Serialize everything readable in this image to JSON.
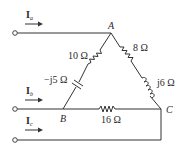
{
  "diagram": {
    "type": "circuit",
    "title": "",
    "nodes": [
      {
        "id": "A",
        "label": "A"
      },
      {
        "id": "B",
        "label": "B"
      },
      {
        "id": "C",
        "label": "C"
      }
    ],
    "currents": [
      {
        "id": "Ia",
        "symbol": "I",
        "subscript": "a",
        "terminal": "a",
        "to_node": "A"
      },
      {
        "id": "Ib",
        "symbol": "I",
        "subscript": "b",
        "terminal": "b",
        "to_node": "B"
      },
      {
        "id": "Ic",
        "symbol": "I",
        "subscript": "c",
        "terminal": "c",
        "to_node": "C"
      }
    ],
    "components": [
      {
        "id": "R_AB",
        "type": "resistor",
        "between": [
          "A",
          "B"
        ],
        "label": "10 Ω"
      },
      {
        "id": "X_AB",
        "type": "capacitor",
        "between": [
          "A",
          "B"
        ],
        "label": "−j5 Ω"
      },
      {
        "id": "R_AC",
        "type": "resistor",
        "between": [
          "A",
          "C"
        ],
        "label": "8 Ω"
      },
      {
        "id": "X_AC",
        "type": "inductor",
        "between": [
          "A",
          "C"
        ],
        "label": "j6 Ω"
      },
      {
        "id": "R_BC",
        "type": "resistor",
        "between": [
          "B",
          "C"
        ],
        "label": "16 Ω"
      }
    ],
    "colors": {
      "wire": "#333333",
      "text": "#2a2a2a",
      "background": "#ffffff"
    }
  }
}
